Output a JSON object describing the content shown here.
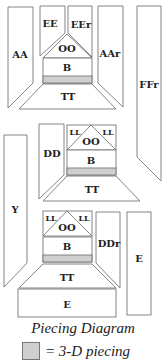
{
  "title": "Piecing Diagram",
  "legend": {
    "swatch_color": "#cfcfcf",
    "label": "= 3-D piecing"
  },
  "colors": {
    "outline": "#777777",
    "shaded": "#cfcfcf",
    "fill": "#ffffff"
  },
  "labels": {
    "AA": "AA",
    "EE": "EE",
    "EEr": "EEr",
    "OO": "OO",
    "B": "B",
    "AAr": "AAr",
    "TT": "TT",
    "FFr": "FFr",
    "DD": "DD",
    "LL": "LL",
    "Y": "Y",
    "DDr": "DDr",
    "E": "E"
  },
  "units": [
    {
      "name": "top-unit",
      "pieces": [
        "AA",
        "EE",
        "EEr",
        "OO",
        "B",
        "AAr",
        "TT"
      ]
    },
    {
      "name": "middle-unit",
      "pieces": [
        "DD",
        "LL",
        "OO",
        "LL",
        "B",
        "TT"
      ]
    },
    {
      "name": "bottom-unit",
      "pieces": [
        "LL",
        "OO",
        "LL",
        "B",
        "DDr",
        "TT",
        "E"
      ]
    },
    {
      "name": "side-strips",
      "pieces": [
        "FFr",
        "Y",
        "E"
      ]
    }
  ]
}
